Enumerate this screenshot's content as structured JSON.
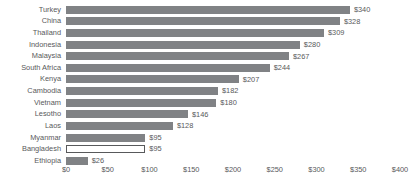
{
  "chart_data": {
    "type": "bar",
    "orientation": "horizontal",
    "title": "",
    "xlabel": "",
    "ylabel": "",
    "xlim": [
      0,
      400
    ],
    "grid": false,
    "legend": null,
    "value_prefix": "$",
    "xticks": [
      "$0",
      "$50",
      "$100",
      "$150",
      "$200",
      "$250",
      "$300",
      "$350",
      "$400"
    ],
    "xtick_values": [
      0,
      50,
      100,
      150,
      200,
      250,
      300,
      350,
      400
    ],
    "categories": [
      "Turkey",
      "China",
      "Thailand",
      "Indonesia",
      "Malaysia",
      "South Africa",
      "Kenya",
      "Cambodia",
      "Vietnam",
      "Lesotho",
      "Laos",
      "Myanmar",
      "Bangladesh",
      "Ethiopia"
    ],
    "values": [
      340,
      328,
      309,
      280,
      267,
      244,
      207,
      182,
      180,
      146,
      128,
      95,
      95,
      26
    ],
    "value_labels": [
      "$340",
      "$328",
      "$309",
      "$280",
      "$267",
      "$244",
      "$207",
      "$182",
      "$180",
      "$146",
      "$128",
      "$95",
      "$95",
      "$26"
    ],
    "highlighted": [
      "Bangladesh"
    ],
    "bars": [
      {
        "label": "Turkey",
        "value": 340,
        "value_label": "$340",
        "style": "filled"
      },
      {
        "label": "China",
        "value": 328,
        "value_label": "$328",
        "style": "filled"
      },
      {
        "label": "Thailand",
        "value": 309,
        "value_label": "$309",
        "style": "filled"
      },
      {
        "label": "Indonesia",
        "value": 280,
        "value_label": "$280",
        "style": "filled"
      },
      {
        "label": "Malaysia",
        "value": 267,
        "value_label": "$267",
        "style": "filled"
      },
      {
        "label": "South Africa",
        "value": 244,
        "value_label": "$244",
        "style": "filled"
      },
      {
        "label": "Kenya",
        "value": 207,
        "value_label": "$207",
        "style": "filled"
      },
      {
        "label": "Cambodia",
        "value": 182,
        "value_label": "$182",
        "style": "filled"
      },
      {
        "label": "Vietnam",
        "value": 180,
        "value_label": "$180",
        "style": "filled"
      },
      {
        "label": "Lesotho",
        "value": 146,
        "value_label": "$146",
        "style": "filled"
      },
      {
        "label": "Laos",
        "value": 128,
        "value_label": "$128",
        "style": "filled"
      },
      {
        "label": "Myanmar",
        "value": 95,
        "value_label": "$95",
        "style": "filled"
      },
      {
        "label": "Bangladesh",
        "value": 95,
        "value_label": "$95",
        "style": "hollow"
      },
      {
        "label": "Ethiopia",
        "value": 26,
        "value_label": "$26",
        "style": "filled"
      }
    ],
    "colors": {
      "bar": "#808285",
      "bar_highlight_fill": "#ffffff",
      "bar_highlight_border": "#58595b",
      "text": "#58595b",
      "background": "#ffffff"
    }
  }
}
